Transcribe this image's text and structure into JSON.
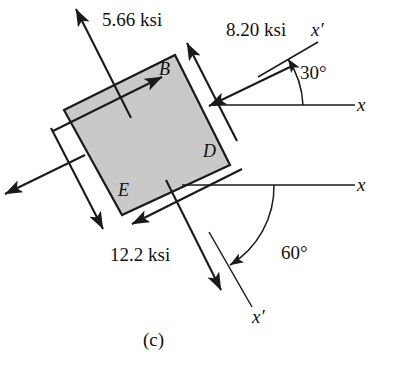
{
  "figure": {
    "part_label": "(c)",
    "element": {
      "fill_color": "#c9c9c9",
      "stroke_color": "#1a1a1a",
      "rotation_degrees": -26.5,
      "corners": [
        {
          "name": "B",
          "label": "B",
          "position": "top"
        },
        {
          "name": "D",
          "label": "D",
          "position": "right"
        },
        {
          "name": "E",
          "label": "E",
          "position": "bottom"
        }
      ]
    },
    "stresses": [
      {
        "id": "normal-tensile-upper-left",
        "value": "5.66 ksi",
        "magnitude": 5.66,
        "units": "ksi",
        "type": "normal",
        "sense": "tension",
        "face": "upper-left"
      },
      {
        "id": "normal-compressive-upper-right",
        "value": "8.20 ksi",
        "magnitude": 8.2,
        "units": "ksi",
        "type": "normal",
        "sense": "compression",
        "face": "upper-right"
      },
      {
        "id": "normal-compressive-lower-right",
        "value": "12.2 ksi",
        "magnitude": 12.2,
        "units": "ksi",
        "type": "normal",
        "sense": "compression",
        "face": "lower-right"
      }
    ],
    "axes": [
      {
        "id": "axis-x-upper",
        "label": "x",
        "orientation": "horizontal"
      },
      {
        "id": "axis-xprime-upper",
        "label": "x′",
        "orientation": "30-degrees-above-horizontal"
      },
      {
        "id": "axis-x-lower",
        "label": "x",
        "orientation": "horizontal"
      },
      {
        "id": "axis-xprime-lower",
        "label": "x′",
        "orientation": "60-degrees-below-horizontal"
      }
    ],
    "angles": [
      {
        "id": "angle-30",
        "label": "30°",
        "degrees": 30,
        "from_axis": "x",
        "to_axis": "x′"
      },
      {
        "id": "angle-60",
        "label": "60°",
        "degrees": 60,
        "from_axis": "x",
        "to_axis": "x′"
      }
    ]
  }
}
